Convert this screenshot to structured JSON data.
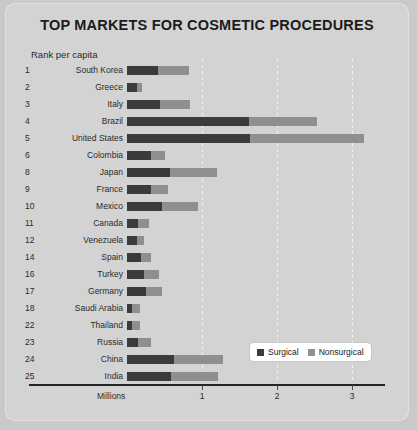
{
  "chart_data": {
    "type": "bar",
    "orientation": "horizontal-stacked",
    "title": "TOP MARKETS FOR COSMETIC PROCEDURES",
    "subtitle": "Rank per capita",
    "xlabel": "Millions",
    "ylabel": "",
    "xlim": [
      0,
      3.45
    ],
    "xticks": [
      1,
      2,
      3
    ],
    "xticklabels": [
      "1",
      "2",
      "3"
    ],
    "grid": true,
    "legend_position": "bottom-right",
    "legend": [
      "Surgical",
      "Nonsurgical"
    ],
    "colors": {
      "surgical": "#3b3b3b",
      "nonsurgical": "#8f8f8f",
      "background": "#d3d3d3",
      "page_background": "#c9c9c9",
      "axis": "#232323",
      "gridline": "#f2f2f2",
      "text": "#2b2b2b",
      "title": "#1b1b1b",
      "legend_background": "#ffffff"
    },
    "categories": [
      "South Korea",
      "Greece",
      "Italy",
      "Brazil",
      "United States",
      "Colombia",
      "Japan",
      "France",
      "Mexico",
      "Canada",
      "Venezuela",
      "Spain",
      "Turkey",
      "Germany",
      "Saudi Arabia",
      "Thailand",
      "Russia",
      "China",
      "India"
    ],
    "ranks": [
      "1",
      "2",
      "3",
      "4",
      "5",
      "6",
      "8",
      "9",
      "10",
      "11",
      "12",
      "14",
      "16",
      "17",
      "18",
      "22",
      "23",
      "24",
      "25"
    ],
    "series": [
      {
        "name": "Surgical",
        "values": [
          0.41,
          0.13,
          0.44,
          1.62,
          1.64,
          0.32,
          0.57,
          0.32,
          0.47,
          0.14,
          0.13,
          0.19,
          0.23,
          0.25,
          0.07,
          0.06,
          0.15,
          0.62,
          0.59
        ]
      },
      {
        "name": "Nonsurgical",
        "values": [
          0.42,
          0.07,
          0.4,
          0.91,
          1.52,
          0.19,
          0.63,
          0.23,
          0.47,
          0.15,
          0.1,
          0.13,
          0.19,
          0.21,
          0.1,
          0.11,
          0.17,
          0.66,
          0.62
        ]
      }
    ],
    "rows": [
      {
        "rank": "1",
        "country": "South Korea",
        "surgical": 0.41,
        "nonsurgical": 0.42,
        "total": 0.83
      },
      {
        "rank": "2",
        "country": "Greece",
        "surgical": 0.13,
        "nonsurgical": 0.07,
        "total": 0.2
      },
      {
        "rank": "3",
        "country": "Italy",
        "surgical": 0.44,
        "nonsurgical": 0.4,
        "total": 0.84
      },
      {
        "rank": "4",
        "country": "Brazil",
        "surgical": 1.62,
        "nonsurgical": 0.91,
        "total": 2.53
      },
      {
        "rank": "5",
        "country": "United States",
        "surgical": 1.64,
        "nonsurgical": 1.52,
        "total": 3.16
      },
      {
        "rank": "6",
        "country": "Colombia",
        "surgical": 0.32,
        "nonsurgical": 0.19,
        "total": 0.51
      },
      {
        "rank": "8",
        "country": "Japan",
        "surgical": 0.57,
        "nonsurgical": 0.63,
        "total": 1.2
      },
      {
        "rank": "9",
        "country": "France",
        "surgical": 0.32,
        "nonsurgical": 0.23,
        "total": 0.55
      },
      {
        "rank": "10",
        "country": "Mexico",
        "surgical": 0.47,
        "nonsurgical": 0.47,
        "total": 0.94
      },
      {
        "rank": "11",
        "country": "Canada",
        "surgical": 0.14,
        "nonsurgical": 0.15,
        "total": 0.29
      },
      {
        "rank": "12",
        "country": "Venezuela",
        "surgical": 0.13,
        "nonsurgical": 0.1,
        "total": 0.23
      },
      {
        "rank": "14",
        "country": "Spain",
        "surgical": 0.19,
        "nonsurgical": 0.13,
        "total": 0.32
      },
      {
        "rank": "16",
        "country": "Turkey",
        "surgical": 0.23,
        "nonsurgical": 0.19,
        "total": 0.42
      },
      {
        "rank": "17",
        "country": "Germany",
        "surgical": 0.25,
        "nonsurgical": 0.21,
        "total": 0.46
      },
      {
        "rank": "18",
        "country": "Saudi Arabia",
        "surgical": 0.07,
        "nonsurgical": 0.1,
        "total": 0.17
      },
      {
        "rank": "22",
        "country": "Thailand",
        "surgical": 0.06,
        "nonsurgical": 0.11,
        "total": 0.17
      },
      {
        "rank": "23",
        "country": "Russia",
        "surgical": 0.15,
        "nonsurgical": 0.17,
        "total": 0.32
      },
      {
        "rank": "24",
        "country": "China",
        "surgical": 0.62,
        "nonsurgical": 0.66,
        "total": 1.28
      },
      {
        "rank": "25",
        "country": "India",
        "surgical": 0.59,
        "nonsurgical": 0.62,
        "total": 1.21
      }
    ]
  }
}
